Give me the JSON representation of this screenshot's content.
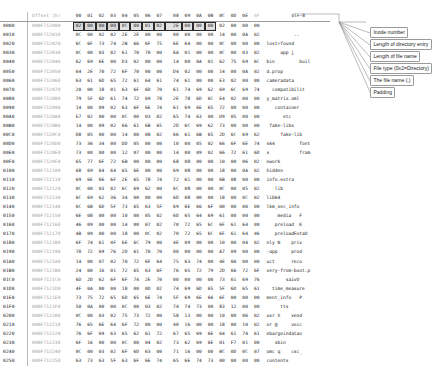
{
  "app": {
    "title": "Hex editor view of ext4 directory block"
  },
  "header": {
    "row_index_label": "",
    "offset_label": "Offset (h)",
    "byte_columns": [
      "00",
      "01",
      "02",
      "03",
      "04",
      "05",
      "06",
      "07",
      "08",
      "09",
      "0A",
      "0B",
      "0C",
      "0D",
      "0E",
      "0F"
    ],
    "text_encoding_label": "UTF-8"
  },
  "callouts": [
    {
      "id": "inode-number",
      "text": "Inode number"
    },
    {
      "id": "dir-entry-length",
      "text": "Length of directory entry"
    },
    {
      "id": "file-name-length",
      "text": "Length of file name"
    },
    {
      "id": "file-type",
      "text": "File type (0x2=Directory)"
    },
    {
      "id": "file-name",
      "text": "The file name (.)"
    },
    {
      "id": "padding",
      "text": "Padding"
    }
  ],
  "highlight_row": 0,
  "highlight_groups": [
    {
      "start": 0,
      "end": 3,
      "name": "inode-number"
    },
    {
      "start": 4,
      "end": 5,
      "name": "dir-entry-length"
    },
    {
      "start": 6,
      "end": 6,
      "name": "file-name-length"
    },
    {
      "start": 7,
      "end": 7,
      "name": "file-type"
    },
    {
      "start": 8,
      "end": 8,
      "name": "file-name"
    },
    {
      "start": 9,
      "end": 11,
      "name": "padding"
    }
  ],
  "rows": [
    {
      "index": "0000",
      "offset": "000F712000",
      "bytes": [
        "02",
        "00",
        "00",
        "00",
        "0C",
        "00",
        "01",
        "02",
        "2E",
        "00",
        "00",
        "00",
        "02",
        "00",
        "00",
        "00"
      ],
      "text": "................"
    },
    {
      "index": "0010",
      "offset": "000F712010",
      "bytes": [
        "0C",
        "00",
        "02",
        "02",
        "2E",
        "2E",
        "00",
        "00",
        "00",
        "00",
        "00",
        "00",
        "14",
        "00",
        "0A",
        "02"
      ],
      "text": "................"
    },
    {
      "index": "0020",
      "offset": "000F712020",
      "bytes": [
        "6C",
        "6F",
        "73",
        "74",
        "2B",
        "66",
        "6F",
        "75",
        "6E",
        "64",
        "00",
        "00",
        "0C",
        "00",
        "00",
        "00"
      ],
      "text": "lost+found......"
    },
    {
      "index": "0030",
      "offset": "000F712030",
      "bytes": [
        "0C",
        "00",
        "03",
        "02",
        "61",
        "70",
        "70",
        "00",
        "6A",
        "01",
        "00",
        "00",
        "0C",
        "00",
        "03",
        "02"
      ],
      "text": "....app j......."
    },
    {
      "index": "0040",
      "offset": "000F712040",
      "bytes": [
        "62",
        "69",
        "6E",
        "00",
        "D3",
        "02",
        "00",
        "00",
        "14",
        "00",
        "0A",
        "01",
        "62",
        "75",
        "69",
        "6C"
      ],
      "text": "bin.........buil"
    },
    {
      "index": "0050",
      "offset": "000F712050",
      "bytes": [
        "64",
        "2E",
        "70",
        "72",
        "6F",
        "70",
        "00",
        "00",
        "D4",
        "02",
        "00",
        "00",
        "14",
        "00",
        "0A",
        "02"
      ],
      "text": "d.prop.........."
    },
    {
      "index": "0060",
      "offset": "000F712060",
      "bytes": [
        "63",
        "61",
        "6D",
        "65",
        "72",
        "61",
        "64",
        "61",
        "74",
        "61",
        "00",
        "00",
        "E3",
        "02",
        "00",
        "00"
      ],
      "text": "cameradata......"
    },
    {
      "index": "0070",
      "offset": "000F712070",
      "bytes": [
        "20",
        "00",
        "18",
        "01",
        "63",
        "6F",
        "6D",
        "70",
        "61",
        "74",
        "69",
        "62",
        "69",
        "6C",
        "69",
        "74"
      ],
      "text": "....compatibilit"
    },
    {
      "index": "0080",
      "offset": "000F712080",
      "bytes": [
        "79",
        "5F",
        "6D",
        "61",
        "74",
        "72",
        "69",
        "78",
        "2E",
        "78",
        "6D",
        "6C",
        "E4",
        "02",
        "00",
        "00"
      ],
      "text": "y_matrix.xml...."
    },
    {
      "index": "0090",
      "offset": "000F712090",
      "bytes": [
        "14",
        "00",
        "09",
        "02",
        "63",
        "6F",
        "6E",
        "74",
        "61",
        "69",
        "6E",
        "65",
        "72",
        "00",
        "00",
        "00"
      ],
      "text": "....container..."
    },
    {
      "index": "00A0",
      "offset": "000F7120A0",
      "bytes": [
        "E7",
        "02",
        "00",
        "00",
        "0C",
        "00",
        "03",
        "02",
        "65",
        "74",
        "63",
        "00",
        "D9",
        "05",
        "00",
        "00"
      ],
      "text": "........etc....."
    },
    {
      "index": "00B0",
      "offset": "000F7120B0",
      "bytes": [
        "14",
        "00",
        "09",
        "02",
        "66",
        "61",
        "6B",
        "65",
        "2D",
        "6C",
        "69",
        "62",
        "73",
        "00",
        "00",
        "00"
      ],
      "text": "....fake-libs..."
    },
    {
      "index": "00C0",
      "offset": "000F7120C0",
      "bytes": [
        "D8",
        "05",
        "00",
        "00",
        "14",
        "00",
        "08",
        "02",
        "66",
        "61",
        "6B",
        "65",
        "2D",
        "6C",
        "69",
        "62"
      ],
      "text": "........fake-lib"
    },
    {
      "index": "00D0",
      "offset": "000F7120D0",
      "bytes": [
        "73",
        "36",
        "34",
        "00",
        "DD",
        "05",
        "00",
        "00",
        "10",
        "00",
        "05",
        "02",
        "66",
        "6F",
        "6E",
        "74"
      ],
      "text": "s64.........font"
    },
    {
      "index": "00E0",
      "offset": "000F7120E0",
      "bytes": [
        "73",
        "00",
        "00",
        "00",
        "12",
        "07",
        "00",
        "00",
        "14",
        "00",
        "09",
        "02",
        "66",
        "72",
        "61",
        "6D"
      ],
      "text": "s...........fram"
    },
    {
      "index": "00F0",
      "offset": "000F7120F0",
      "bytes": [
        "65",
        "77",
        "6F",
        "72",
        "6B",
        "00",
        "00",
        "00",
        "68",
        "08",
        "00",
        "00",
        "10",
        "00",
        "06",
        "02"
      ],
      "text": "ework...h......."
    },
    {
      "index": "0100",
      "offset": "000F712100",
      "bytes": [
        "68",
        "69",
        "64",
        "64",
        "65",
        "6E",
        "00",
        "00",
        "69",
        "08",
        "00",
        "00",
        "18",
        "00",
        "0A",
        "02"
      ],
      "text": "hidden..i......."
    },
    {
      "index": "0110",
      "offset": "000F712110",
      "bytes": [
        "69",
        "6E",
        "66",
        "6F",
        "2E",
        "65",
        "78",
        "74",
        "72",
        "61",
        "00",
        "00",
        "6B",
        "08",
        "00",
        "00"
      ],
      "text": "info.extra..k..."
    },
    {
      "index": "0120",
      "offset": "000F712120",
      "bytes": [
        "0C",
        "00",
        "03",
        "02",
        "6C",
        "69",
        "62",
        "00",
        "6C",
        "08",
        "00",
        "00",
        "0C",
        "00",
        "05",
        "02"
      ],
      "text": "....lib.l......."
    },
    {
      "index": "0130",
      "offset": "000F712130",
      "bytes": [
        "6C",
        "69",
        "62",
        "36",
        "34",
        "00",
        "00",
        "00",
        "6D",
        "08",
        "00",
        "00",
        "18",
        "00",
        "0C",
        "02"
      ],
      "text": "lib64...m......."
    },
    {
      "index": "0140",
      "offset": "000F712140",
      "bytes": [
        "6C",
        "6B",
        "6D",
        "5F",
        "73",
        "65",
        "63",
        "5F",
        "69",
        "6E",
        "66",
        "6F",
        "00",
        "00",
        "00",
        "00"
      ],
      "text": "lkm_sec_info...."
    },
    {
      "index": "0150",
      "offset": "000F712150",
      "bytes": [
        "6E",
        "08",
        "00",
        "00",
        "10",
        "00",
        "05",
        "02",
        "6D",
        "65",
        "64",
        "69",
        "61",
        "00",
        "00",
        "00"
      ],
      "text": "n.......media..."
    },
    {
      "index": "0160",
      "offset": "000F712160",
      "bytes": [
        "46",
        "09",
        "00",
        "00",
        "14",
        "00",
        "07",
        "02",
        "70",
        "72",
        "65",
        "6C",
        "6F",
        "61",
        "64",
        "00"
      ],
      "text": "F.......preload."
    },
    {
      "index": "0170",
      "offset": "000F712170",
      "bytes": [
        "4B",
        "09",
        "00",
        "00",
        "18",
        "00",
        "0C",
        "02",
        "70",
        "72",
        "65",
        "6C",
        "6F",
        "61",
        "64",
        "46"
      ],
      "text": "K.......preloadF"
    },
    {
      "index": "0180",
      "offset": "000F712180",
      "bytes": [
        "6F",
        "74",
        "61",
        "4F",
        "6E",
        "6C",
        "79",
        "00",
        "4E",
        "09",
        "00",
        "00",
        "10",
        "00",
        "04",
        "02"
      ],
      "text": "otaOnly.N......."
    },
    {
      "index": "0190",
      "offset": "000F712190",
      "bytes": [
        "70",
        "72",
        "69",
        "76",
        "2D",
        "61",
        "70",
        "70",
        "00",
        "00",
        "00",
        "00",
        "A7",
        "09",
        "00",
        "00"
      ],
      "text": "priv-app........"
    },
    {
      "index": "01A0",
      "offset": "000F7121A0",
      "bytes": [
        "14",
        "00",
        "07",
        "02",
        "70",
        "72",
        "6F",
        "64",
        "75",
        "63",
        "74",
        "00",
        "4E",
        "0A",
        "00",
        "00"
      ],
      "text": "....product.N..."
    },
    {
      "index": "01B0",
      "offset": "000F7121B0",
      "bytes": [
        "24",
        "00",
        "16",
        "01",
        "72",
        "65",
        "63",
        "6F",
        "76",
        "65",
        "72",
        "79",
        "2D",
        "66",
        "72",
        "6F"
      ],
      "text": "$...recovery-fro"
    },
    {
      "index": "01C0",
      "offset": "000F7121C0",
      "bytes": [
        "6D",
        "2D",
        "62",
        "6F",
        "6F",
        "74",
        "2E",
        "70",
        "00",
        "00",
        "00",
        "00",
        "73",
        "61",
        "69",
        "76"
      ],
      "text": "m-boot.p....saiv"
    },
    {
      "index": "01D0",
      "offset": "000F7121D0",
      "bytes": [
        "4F",
        "0A",
        "00",
        "00",
        "18",
        "00",
        "0D",
        "02",
        "74",
        "69",
        "6D",
        "65",
        "5F",
        "6D",
        "65",
        "61"
      ],
      "text": "O.......time_mea"
    },
    {
      "index": "01E0",
      "offset": "000F7121E0",
      "bytes": [
        "73",
        "75",
        "72",
        "65",
        "6D",
        "65",
        "6E",
        "74",
        "5F",
        "69",
        "6E",
        "66",
        "6F",
        "00",
        "00",
        "00"
      ],
      "text": "surement_info..."
    },
    {
      "index": "01F0",
      "offset": "000F7121F0",
      "bytes": [
        "50",
        "0A",
        "00",
        "00",
        "0C",
        "00",
        "03",
        "02",
        "74",
        "74",
        "73",
        "00",
        "83",
        "12",
        "00",
        "00"
      ],
      "text": "P.......tts....."
    },
    {
      "index": "0200",
      "offset": "000F712200",
      "bytes": [
        "0C",
        "00",
        "03",
        "02",
        "75",
        "73",
        "72",
        "00",
        "58",
        "13",
        "00",
        "00",
        "10",
        "00",
        "06",
        "02"
      ],
      "text": "....usr.X......."
    },
    {
      "index": "0210",
      "offset": "000F712210",
      "bytes": [
        "76",
        "65",
        "6E",
        "64",
        "6F",
        "72",
        "00",
        "00",
        "40",
        "16",
        "00",
        "00",
        "18",
        "00",
        "10",
        "02"
      ],
      "text": "vendor..@......."
    },
    {
      "index": "0220",
      "offset": "000F712220",
      "bytes": [
        "76",
        "6F",
        "69",
        "63",
        "65",
        "62",
        "61",
        "72",
        "67",
        "65",
        "69",
        "6E",
        "64",
        "61",
        "74",
        "61"
      ],
      "text": "voicebargeindata"
    },
    {
      "index": "0230",
      "offset": "000F712230",
      "bytes": [
        "6F",
        "16",
        "00",
        "00",
        "0C",
        "00",
        "04",
        "02",
        "73",
        "62",
        "69",
        "6E",
        "01",
        "F7",
        "01",
        "00"
      ],
      "text": "o.......sbin...."
    },
    {
      "index": "0240",
      "offset": "000F712240",
      "bytes": [
        "0C",
        "00",
        "03",
        "02",
        "6F",
        "6D",
        "63",
        "00",
        "71",
        "16",
        "00",
        "00",
        "BC",
        "0D",
        "0C",
        "07"
      ],
      "text": "....omc.q......."
    },
    {
      "index": "0250",
      "offset": "000F712250",
      "bytes": [
        "63",
        "73",
        "63",
        "5F",
        "63",
        "6F",
        "6E",
        "74",
        "65",
        "6E",
        "74",
        "73",
        "00",
        "00",
        "00",
        "00"
      ],
      "text": "csc_contents...."
    }
  ],
  "text_column_render": [
    [
      "",
      ""
    ],
    [
      "",
      ".."
    ],
    [
      "lost+found",
      ""
    ],
    [
      "app j",
      ""
    ],
    [
      "bin",
      "buil"
    ],
    [
      "d.prop",
      ""
    ],
    [
      "cameradata",
      ""
    ],
    [
      "compatibilit",
      ""
    ],
    [
      "y_matrix.xml",
      ""
    ],
    [
      "container",
      ""
    ],
    [
      "etc",
      ""
    ],
    [
      "fake-libs",
      ""
    ],
    [
      "fake-lib",
      ""
    ],
    [
      "s64",
      "font"
    ],
    [
      "s",
      "fram"
    ],
    [
      "ework",
      ""
    ],
    [
      "hidden",
      ""
    ],
    [
      "info.extra",
      ""
    ],
    [
      "lib",
      ""
    ],
    [
      "lib64",
      ""
    ],
    [
      "lkm_sec_info",
      ""
    ],
    [
      "media",
      "F"
    ],
    [
      "preload",
      "K"
    ],
    [
      "preloadFotaO",
      ""
    ],
    [
      "nly N",
      "priv"
    ],
    [
      "-app",
      "prod"
    ],
    [
      "uct",
      "reco"
    ],
    [
      "very-from-boot.p",
      ""
    ],
    [
      "saivO",
      ""
    ],
    [
      "time_measure",
      ""
    ],
    [
      "ment_info",
      "P"
    ],
    [
      "tts",
      ""
    ],
    [
      "usr X",
      "vend"
    ],
    [
      "or @",
      "voic"
    ],
    [
      "ebargeindatao",
      ""
    ],
    [
      "sbin",
      ""
    ],
    [
      "omc q",
      "csc_"
    ],
    [
      "contents",
      ""
    ]
  ],
  "text_lines": [
    "",
    "          ..",
    "lost+found",
    "     app j",
    "bin         buil",
    "d.prop",
    "cameradata",
    "  compatibilit",
    "y_matrix.xml",
    "   container",
    "      etc",
    " fake-libs",
    "     fake-lib",
    "s64         font",
    "s           fram",
    "ework",
    "hidden",
    "info.extra",
    "   lib",
    "lib64",
    "lkm_sec_info",
    "    media   F",
    "   preload  K",
    "   preloadFotaO",
    "nly N    priv",
    "-app     prod",
    "uct      reco",
    "very-from-boot.p",
    "       saivO",
    "  time_measure",
    "ment_info   P",
    "     tts",
    "usr X    vend",
    "or @     voic",
    "ebargeindatao",
    "   sbin",
    "omc q    csc_",
    "contents"
  ],
  "colors": {
    "background": "#ffffff",
    "text": "#1a1a1a",
    "offset_text": "#9b9b9b",
    "grid_line": "#bbbbbb",
    "highlight_fill": "#dcdcdc",
    "highlight_border": "#2a2a2a",
    "callout_border": "#9a9a9a",
    "leader_line": "#8f8f8f"
  }
}
